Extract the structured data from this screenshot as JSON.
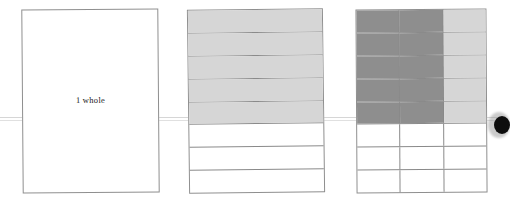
{
  "figure": {
    "caption_text": "1 whole",
    "colors": {
      "outline": "#8f8f8f",
      "inner_rule": "#8a8a8a",
      "shade_light": "#d6d6d6",
      "shade_medium": "#d0d0d0",
      "shade_dark": "#8e8e8e",
      "page_background": "#ffffff",
      "scan_line": "#cfcfcf",
      "blob": "#0d0d0d",
      "text": "#1a1a1a"
    },
    "models": [
      {
        "name": "one-whole",
        "label": "1 whole",
        "rows": 1,
        "columns": 1,
        "total_parts": 1,
        "shaded_parts": 0,
        "fraction": "1",
        "cells": [
          [
            "none"
          ]
        ]
      },
      {
        "name": "eighths",
        "label": "",
        "rows": 8,
        "columns": 1,
        "total_parts": 8,
        "shaded_parts": 5,
        "fraction": "5/8",
        "cells": [
          [
            "light"
          ],
          [
            "light"
          ],
          [
            "light"
          ],
          [
            "light"
          ],
          [
            "light"
          ],
          [
            "none"
          ],
          [
            "none"
          ],
          [
            "none"
          ]
        ]
      },
      {
        "name": "twenty-fourths",
        "label": "",
        "rows": 8,
        "columns": 3,
        "total_parts": 24,
        "shaded_parts": 15,
        "fraction": "15/24",
        "cells": [
          [
            "dark",
            "dark",
            "light"
          ],
          [
            "dark",
            "dark",
            "light"
          ],
          [
            "dark",
            "dark",
            "light"
          ],
          [
            "dark",
            "dark",
            "light"
          ],
          [
            "dark",
            "dark",
            "light"
          ],
          [
            "none",
            "none",
            "none"
          ],
          [
            "none",
            "none",
            "none"
          ],
          [
            "none",
            "none",
            "none"
          ]
        ]
      }
    ],
    "artifacts": {
      "scan_line_label": "horizontal-scan-line",
      "edge_mark_label": "page-edge-ink-mark"
    }
  }
}
